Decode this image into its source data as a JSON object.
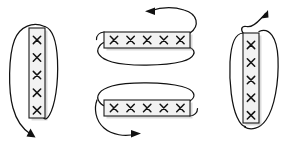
{
  "figure": {
    "title": "",
    "background_color": "#ffffff",
    "stroke_color": "#111111",
    "bar_fill_color": "#f2f2f2",
    "bar_border_color": "#1a1a1a",
    "width": 283,
    "height": 150
  },
  "elements": [
    {
      "id": "left-group",
      "name": "vertical-bar-loop-left",
      "orientation": "vertical",
      "marks_count": 5,
      "mark_symbol": "x",
      "loop_side": "left",
      "arrow_direction": "down-right",
      "arrow_position": "bottom",
      "bar": {
        "x": 29,
        "y": 28,
        "width": 16,
        "height": 90
      }
    },
    {
      "id": "top-middle-group",
      "name": "horizontal-bar-loop-top",
      "orientation": "horizontal",
      "marks_count": 5,
      "mark_symbol": "x",
      "loop_side": "below",
      "arrow_direction": "left",
      "arrow_position": "top",
      "bar": {
        "x": 104,
        "y": 32,
        "width": 86,
        "height": 16
      }
    },
    {
      "id": "bottom-middle-group",
      "name": "horizontal-bar-loop-bottom",
      "orientation": "horizontal",
      "marks_count": 5,
      "mark_symbol": "x",
      "loop_side": "above",
      "arrow_direction": "right",
      "arrow_position": "bottom",
      "bar": {
        "x": 104,
        "y": 100,
        "width": 86,
        "height": 16
      }
    },
    {
      "id": "right-group",
      "name": "vertical-bar-loop-right",
      "orientation": "vertical",
      "marks_count": 5,
      "mark_symbol": "x",
      "loop_side": "right",
      "arrow_direction": "up-left",
      "arrow_position": "top",
      "bar": {
        "x": 243,
        "y": 33,
        "width": 16,
        "height": 90
      }
    }
  ]
}
